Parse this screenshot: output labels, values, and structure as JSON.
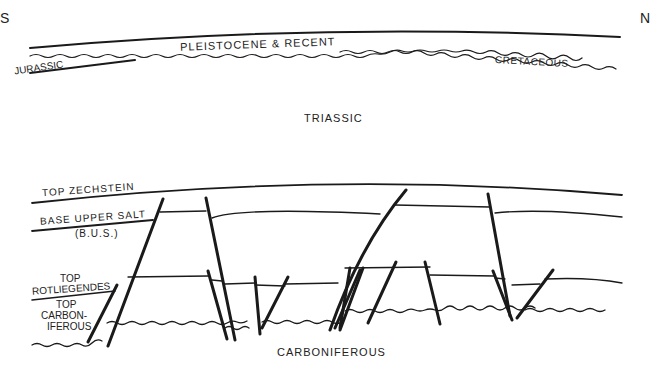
{
  "diagram": {
    "type": "geological cross-section",
    "orientation": {
      "left": "S",
      "right": "N"
    },
    "upper_section": {
      "units": [
        "PLEISTOCENE & RECENT",
        "JURASSIC",
        "CRETACEOUS",
        "TRIASSIC"
      ]
    },
    "lower_section": {
      "horizons": [
        "TOP ZECHSTEIN",
        "BASE UPPER SALT",
        "(B.U.S.)",
        "TOP",
        "ROTLIEGENDES",
        "TOP",
        "CARBON-",
        "IFEROUS"
      ],
      "basement": "CARBONIFEROUS"
    }
  },
  "colors": {
    "ink": "#1a1a1a",
    "background": "#ffffff"
  }
}
